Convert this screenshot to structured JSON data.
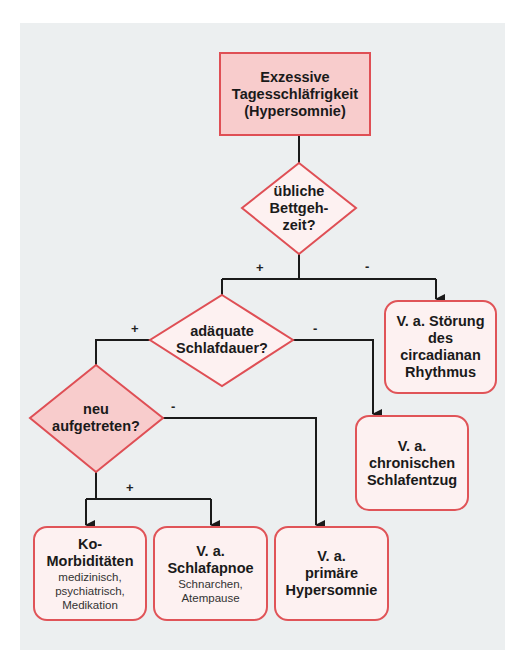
{
  "diagram": {
    "start": {
      "lines": [
        "Exzessive",
        "Tagesschläfrigkeit",
        "(Hypersomnie)"
      ]
    },
    "decisions": [
      {
        "id": "bedtime",
        "lines": [
          "übliche",
          "Bettgeh-",
          "zeit?"
        ],
        "yes": "+",
        "no": "-"
      },
      {
        "id": "sleep_duration",
        "lines": [
          "adäquate",
          "Schlafdauer?"
        ],
        "yes": "+",
        "no": "-"
      },
      {
        "id": "new_onset",
        "lines": [
          "neu",
          "aufgetreten?"
        ],
        "yes": "+",
        "no": "-"
      }
    ],
    "outcomes": [
      {
        "id": "circadian",
        "title": [
          "V. a. Störung",
          "des circadianan",
          "Rhythmus"
        ],
        "sub": []
      },
      {
        "id": "chronic_deprivation",
        "title": [
          "V. a.",
          "chronischen",
          "Schlafentzug"
        ],
        "sub": []
      },
      {
        "id": "comorbidities",
        "title": [
          "Ko-",
          "Morbiditäten"
        ],
        "sub": [
          "medizinisch,",
          "psychiatrisch,",
          "Medikation"
        ]
      },
      {
        "id": "sleep_apnea",
        "title": [
          "V. a.",
          "Schlafapnoe"
        ],
        "sub": [
          "Schnarchen,",
          "Atempause"
        ]
      },
      {
        "id": "primary_hypersomnia",
        "title": [
          "V. a.",
          "primäre",
          "Hypersomnie"
        ],
        "sub": []
      }
    ]
  },
  "colors": {
    "background": "#eceff0",
    "border_red": "#df4f55",
    "fill_pink": "#f8cccc",
    "fill_light": "#fdf1f1",
    "line": "#1a1a1a"
  }
}
